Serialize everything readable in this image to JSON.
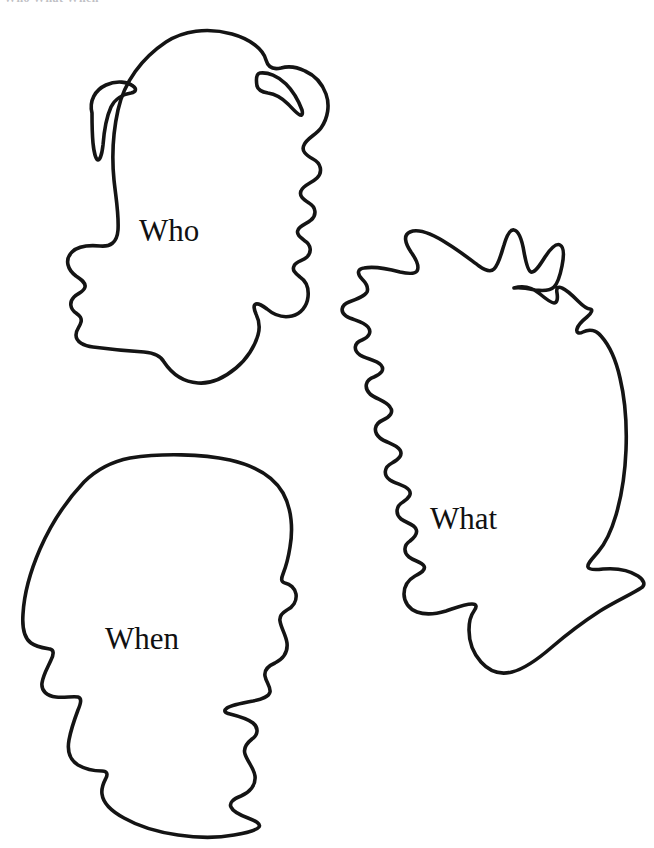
{
  "document": {
    "type": "line-art worksheet",
    "title_fragment": "Who What When",
    "background_color": "#ffffff",
    "ink_color": "#141414"
  },
  "faces": [
    {
      "id": "who",
      "label": "Who",
      "description": "profile head with wavy hair facing right",
      "icon_name": "face-profile-wavy-hair-icon",
      "position": {
        "x": 139,
        "y": 215
      }
    },
    {
      "id": "what",
      "label": "What",
      "description": "profile head with spiky hair facing left",
      "icon_name": "face-profile-spiky-hair-icon",
      "position": {
        "x": 430,
        "y": 503
      }
    },
    {
      "id": "when",
      "label": "When",
      "description": "profile head with smooth short hair facing right",
      "icon_name": "face-profile-smooth-hair-icon",
      "position": {
        "x": 105,
        "y": 623
      }
    }
  ]
}
